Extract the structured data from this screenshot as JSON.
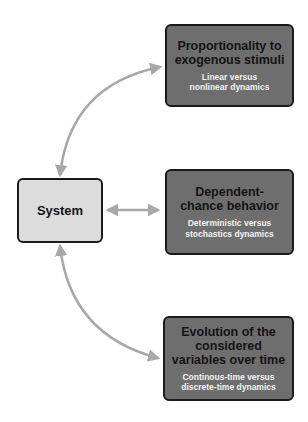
{
  "diagram": {
    "center": {
      "label": "System"
    },
    "nodes": [
      {
        "title": "Proportionality to exogenous stimuli",
        "subtitle": "Linear versus nonlinear dynamics"
      },
      {
        "title": "Dependent-chance behavior",
        "subtitle": "Deterministic versus stochastics dynamics"
      },
      {
        "title": "Evolution of the considered variables over time",
        "subtitle": "Continous-time versus discrete-time dynamics"
      }
    ],
    "edges": [
      {
        "from": "System",
        "to": "Proportionality to exogenous stimuli",
        "type": "bidirectional-curved"
      },
      {
        "from": "System",
        "to": "Dependent-chance behavior",
        "type": "bidirectional-straight"
      },
      {
        "from": "System",
        "to": "Evolution of the considered variables over time",
        "type": "bidirectional-curved"
      }
    ],
    "colors": {
      "node_fill": "#6e6e6e",
      "center_fill": "#dcdcdc",
      "arrow": "#a8a8a8",
      "border": "#1a1a1a"
    }
  }
}
